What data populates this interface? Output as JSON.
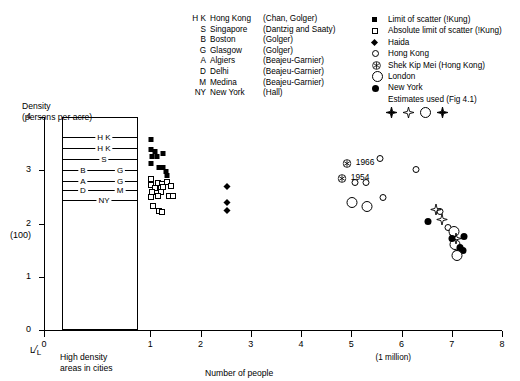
{
  "legend_left": {
    "title": "city-source-key",
    "rows": [
      {
        "code": "H K",
        "city": "Hong Kong",
        "source": "(Chan, Golger)"
      },
      {
        "code": "S",
        "city": "Singapore",
        "source": "(Dantzig and Saaty)"
      },
      {
        "code": "B",
        "city": "Boston",
        "source": "(Golger)"
      },
      {
        "code": "G",
        "city": "Glasgow",
        "source": "(Golger)"
      },
      {
        "code": "A",
        "city": "Algiers",
        "source": "(Beajeu-Garnier)"
      },
      {
        "code": "D",
        "city": "Delhi",
        "source": "(Beajeu-Garnier)"
      },
      {
        "code": "M",
        "city": "Medina",
        "source": "(Beajeu-Garnier)"
      },
      {
        "code": "NY",
        "city": "New York",
        "source": "(Hall)"
      }
    ]
  },
  "legend_right": {
    "rows": [
      {
        "symbol": "filled-square",
        "label": "Limit of scatter (!Kung)"
      },
      {
        "symbol": "open-square",
        "label": "Absolute limit of scatter (!Kung)"
      },
      {
        "symbol": "filled-diamond",
        "label": "Haida"
      },
      {
        "symbol": "open-circle",
        "label": "Hong Kong"
      },
      {
        "symbol": "circled-star",
        "label": "Shek Kip Mei (Hong Kong)"
      },
      {
        "symbol": "large-open-circle",
        "label": "London"
      },
      {
        "symbol": "filled-circle",
        "label": "New York"
      }
    ],
    "estimates_label": "Estimates used  (Fig 4.1)",
    "estimates_symbols": [
      "filled-burst",
      "open-burst",
      "large-open-circle",
      "filled-burst"
    ]
  },
  "chart_data": {
    "type": "scatter",
    "title": "",
    "xlabel": "Number of people",
    "ylabel": "Density",
    "ylabel_sub": "(persons per acre)",
    "xlim": [
      0,
      8
    ],
    "ylim": [
      0,
      4
    ],
    "xticks": [
      "0",
      "1",
      "2",
      "3",
      "4",
      "5",
      "6",
      "7",
      "8"
    ],
    "yticks": [
      "0",
      "1",
      "2",
      "3",
      "4"
    ],
    "y_axis_note": "(100)",
    "y_axis_note_at": "2",
    "x_axis_note": "(1 million)",
    "x_axis_note_at": "6",
    "corner_label": "L/L",
    "inset_label": "High density areas in cities",
    "grid": false,
    "legend_position": "top",
    "annotations": [
      {
        "text": "1966",
        "x": 5.05,
        "y": 3.13,
        "symbol": "circled-star"
      },
      {
        "text": "1954",
        "x": 4.95,
        "y": 2.86,
        "symbol": "circled-star"
      }
    ],
    "inset_box": {
      "x_range": [
        0.02,
        0.78
      ],
      "y_range": [
        0,
        4
      ],
      "lines": [
        {
          "label_left": "H K",
          "label_right": "",
          "y": 3.62
        },
        {
          "label_left": "H K",
          "label_right": "",
          "y": 3.42
        },
        {
          "label_left": "S",
          "label_right": "",
          "y": 3.22
        },
        {
          "label_left": "B",
          "label_right": "G",
          "y": 3.0
        },
        {
          "label_left": "A",
          "label_right": "G",
          "y": 2.8
        },
        {
          "label_left": "D",
          "label_right": "M",
          "y": 2.62
        },
        {
          "label_left": "NY",
          "label_right": "",
          "y": 2.44
        }
      ]
    },
    "series": [
      {
        "name": "Limit of scatter (!Kung)",
        "symbol": "filled-square",
        "points": [
          {
            "x": 1.02,
            "y": 3.62
          },
          {
            "x": 1.02,
            "y": 3.44
          },
          {
            "x": 1.1,
            "y": 3.4
          },
          {
            "x": 1.04,
            "y": 3.3
          },
          {
            "x": 1.13,
            "y": 3.31
          },
          {
            "x": 1.26,
            "y": 3.36
          },
          {
            "x": 1.02,
            "y": 3.18
          },
          {
            "x": 1.17,
            "y": 3.1
          },
          {
            "x": 1.25,
            "y": 3.1
          },
          {
            "x": 1.31,
            "y": 3.02
          },
          {
            "x": 1.33,
            "y": 2.94
          }
        ]
      },
      {
        "name": "Absolute limit of scatter (!Kung)",
        "symbol": "open-square",
        "points": [
          {
            "x": 1.02,
            "y": 2.88
          },
          {
            "x": 1.02,
            "y": 2.76
          },
          {
            "x": 1.16,
            "y": 2.8
          },
          {
            "x": 1.24,
            "y": 2.78
          },
          {
            "x": 1.33,
            "y": 2.81
          },
          {
            "x": 1.1,
            "y": 2.7
          },
          {
            "x": 1.21,
            "y": 2.71
          },
          {
            "x": 1.26,
            "y": 2.72
          },
          {
            "x": 1.41,
            "y": 2.74
          },
          {
            "x": 1.04,
            "y": 2.62
          },
          {
            "x": 1.21,
            "y": 2.63
          },
          {
            "x": 1.02,
            "y": 2.54
          },
          {
            "x": 1.16,
            "y": 2.55
          },
          {
            "x": 1.38,
            "y": 2.56
          },
          {
            "x": 1.46,
            "y": 2.56
          },
          {
            "x": 1.06,
            "y": 2.36
          },
          {
            "x": 1.18,
            "y": 2.27
          },
          {
            "x": 1.24,
            "y": 2.26
          }
        ]
      },
      {
        "name": "Haida",
        "symbol": "filled-diamond",
        "points": [
          {
            "x": 2.52,
            "y": 2.74
          },
          {
            "x": 2.52,
            "y": 2.45
          },
          {
            "x": 2.52,
            "y": 2.3
          }
        ]
      },
      {
        "name": "Hong Kong",
        "symbol": "open-circle",
        "points": [
          {
            "x": 5.58,
            "y": 3.24
          },
          {
            "x": 6.28,
            "y": 3.05
          },
          {
            "x": 5.07,
            "y": 2.79
          },
          {
            "x": 5.3,
            "y": 2.79
          },
          {
            "x": 5.63,
            "y": 2.51
          },
          {
            "x": 6.77,
            "y": 2.25
          },
          {
            "x": 6.93,
            "y": 1.95
          },
          {
            "x": 7.03,
            "y": 1.82
          }
        ]
      },
      {
        "name": "Shek Kip Mei (Hong Kong)",
        "symbol": "circled-star",
        "points": [
          {
            "x": 4.92,
            "y": 3.13
          },
          {
            "x": 4.82,
            "y": 2.86
          }
        ]
      },
      {
        "name": "London",
        "symbol": "large-open-circle",
        "points": [
          {
            "x": 5.02,
            "y": 2.38
          },
          {
            "x": 5.32,
            "y": 2.31
          },
          {
            "x": 7.04,
            "y": 1.84
          },
          {
            "x": 7.06,
            "y": 1.6
          }
        ]
      },
      {
        "name": "New York",
        "symbol": "filled-circle",
        "points": [
          {
            "x": 6.53,
            "y": 2.06
          },
          {
            "x": 7.0,
            "y": 1.74
          },
          {
            "x": 7.24,
            "y": 1.79
          },
          {
            "x": 7.16,
            "y": 1.58
          },
          {
            "x": 7.22,
            "y": 1.52
          }
        ]
      },
      {
        "name": "Estimates used (Fig 4.1)",
        "symbol": "burst",
        "points": [
          {
            "x": 6.8,
            "y": 2.06,
            "style": "open-burst"
          },
          {
            "x": 6.68,
            "y": 2.25,
            "style": "open-burst"
          },
          {
            "x": 7.08,
            "y": 1.7,
            "style": "open-burst"
          },
          {
            "x": 7.14,
            "y": 1.46,
            "style": "filled-burst"
          },
          {
            "x": 7.1,
            "y": 1.39,
            "style": "large-open-circle"
          }
        ]
      }
    ]
  }
}
